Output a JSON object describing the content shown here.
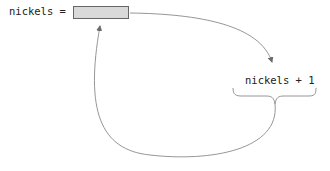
{
  "diagram": {
    "variable_label": "nickels =",
    "expression_label": "nickels + 1",
    "box_fill": "#d9d9d9",
    "box_border": "#666666",
    "arrow_color": "#8a8a8a",
    "arrows": [
      {
        "from": "variable-box",
        "to": "expression",
        "description": "value read into expression"
      },
      {
        "from": "expression-brace",
        "to": "variable-box",
        "description": "result assigned back to variable"
      }
    ]
  }
}
